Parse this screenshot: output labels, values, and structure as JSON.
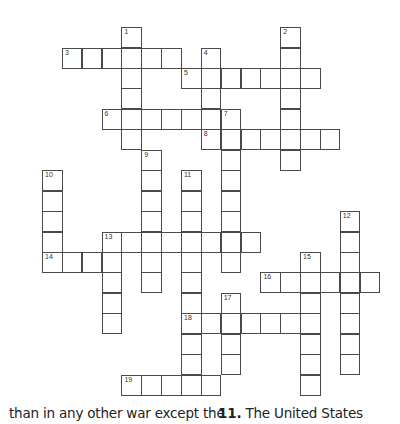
{
  "puzzle": {
    "grid_origin": {
      "x": 42,
      "y": 27
    },
    "cell_w": 19.85,
    "cell_h": 20.45,
    "words": [
      {
        "number": 1,
        "dir": "down",
        "col": 4,
        "row": 0,
        "length": 6
      },
      {
        "number": 2,
        "dir": "down",
        "col": 12,
        "row": 0,
        "length": 7
      },
      {
        "number": 3,
        "dir": "across",
        "col": 1,
        "row": 1,
        "length": 6
      },
      {
        "number": 4,
        "dir": "down",
        "col": 8,
        "row": 1,
        "length": 5
      },
      {
        "number": 5,
        "dir": "across",
        "col": 7,
        "row": 2,
        "length": 7
      },
      {
        "number": 6,
        "dir": "across",
        "col": 3,
        "row": 4,
        "length": 7
      },
      {
        "number": 7,
        "dir": "down",
        "col": 9,
        "row": 4,
        "length": 8
      },
      {
        "number": 8,
        "dir": "across",
        "col": 8,
        "row": 5,
        "length": 7
      },
      {
        "number": 9,
        "dir": "down",
        "col": 5,
        "row": 6,
        "length": 7
      },
      {
        "number": 10,
        "dir": "down",
        "col": 0,
        "row": 7,
        "length": 5
      },
      {
        "number": 11,
        "dir": "down",
        "col": 7,
        "row": 7,
        "length": 11
      },
      {
        "number": 12,
        "dir": "down",
        "col": 15,
        "row": 9,
        "length": 8
      },
      {
        "number": 13,
        "dir": "across",
        "col": 3,
        "row": 10,
        "length": 8
      },
      {
        "number": 13,
        "dir": "down",
        "col": 3,
        "row": 10,
        "length": 5
      },
      {
        "number": 14,
        "dir": "across",
        "col": 0,
        "row": 11,
        "length": 4
      },
      {
        "number": 15,
        "dir": "down",
        "col": 13,
        "row": 11,
        "length": 7
      },
      {
        "number": 16,
        "dir": "across",
        "col": 11,
        "row": 12,
        "length": 6
      },
      {
        "number": 17,
        "dir": "down",
        "col": 9,
        "row": 13,
        "length": 4
      },
      {
        "number": 18,
        "dir": "across",
        "col": 7,
        "row": 14,
        "length": 7
      },
      {
        "number": 19,
        "dir": "across",
        "col": 4,
        "row": 17,
        "length": 5
      }
    ]
  },
  "clues": {
    "left_fragment": "than in any other war except the",
    "right_number": "11.",
    "right_text": " The United States"
  }
}
